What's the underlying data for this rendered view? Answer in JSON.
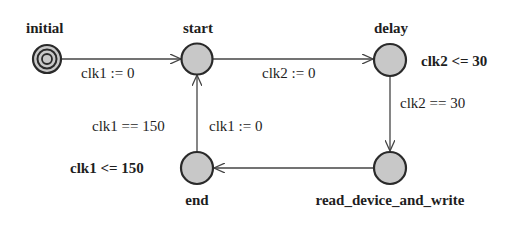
{
  "diagram": {
    "type": "timed-automaton",
    "colors": {
      "state_fill": "#c8c8c8",
      "stroke": "#2a2a2a",
      "edge": "#444444",
      "text": "#1e1e1e",
      "background": "#ffffff"
    },
    "states": [
      {
        "id": "initial",
        "name": "initial",
        "initial": true,
        "invariant": null
      },
      {
        "id": "start",
        "name": "start",
        "initial": false,
        "invariant": null
      },
      {
        "id": "delay",
        "name": "delay",
        "initial": false,
        "invariant": "clk2 <= 30"
      },
      {
        "id": "read_device_and_write",
        "name": "read_device_and_write",
        "initial": false,
        "invariant": null
      },
      {
        "id": "end",
        "name": "end",
        "initial": false,
        "invariant": "clk1 <= 150"
      }
    ],
    "edges": [
      {
        "from": "initial",
        "to": "start",
        "guard": null,
        "update": "clk1 := 0"
      },
      {
        "from": "start",
        "to": "delay",
        "guard": null,
        "update": "clk2 := 0"
      },
      {
        "from": "delay",
        "to": "read_device_and_write",
        "guard": "clk2 == 30",
        "update": null
      },
      {
        "from": "read_device_and_write",
        "to": "end",
        "guard": null,
        "update": null
      },
      {
        "from": "end",
        "to": "start",
        "guard": "clk1 == 150",
        "update": "clk1 := 0"
      }
    ]
  },
  "labels": {
    "initial": "initial",
    "start": "start",
    "delay": "delay",
    "read_device_and_write": "read_device_and_write",
    "end": "end",
    "delay_invariant": "clk2 <= 30",
    "end_invariant": "clk1 <= 150",
    "edge_initial_start_update": "clk1 := 0",
    "edge_start_delay_update": "clk2 := 0",
    "edge_delay_read_guard": "clk2 == 30",
    "edge_end_start_guard": "clk1 == 150",
    "edge_end_start_update": "clk1 := 0"
  }
}
